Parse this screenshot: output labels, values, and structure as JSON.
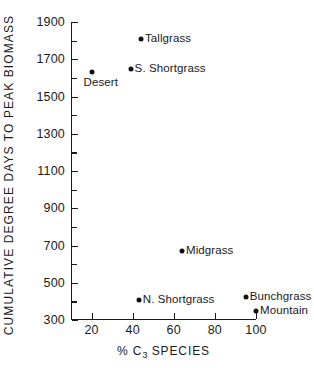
{
  "chart_data": {
    "type": "scatter",
    "title": "",
    "xlabel": "% C3 SPECIES",
    "ylabel": "CUMULATIVE DEGREE DAYS TO PEAK BIOMASS",
    "xlim": [
      10,
      100
    ],
    "ylim": [
      300,
      1900
    ],
    "grid": false,
    "legend": "none",
    "xticks": [
      20,
      40,
      60,
      80,
      100
    ],
    "xtick_labels": [
      "20",
      "40",
      "60",
      "80",
      "100"
    ],
    "yticks": [
      300,
      500,
      700,
      900,
      1100,
      1300,
      1500,
      1700,
      1900
    ],
    "ytick_labels": [
      "300",
      "500",
      "700",
      "900",
      "1100",
      "1300",
      "1500",
      "1700",
      "1900"
    ],
    "y_minor_ticks": [
      400,
      600,
      800,
      1000,
      1200,
      1400,
      1600,
      1800
    ],
    "points": [
      {
        "label": "Tallgrass",
        "x": 44,
        "y": 1810,
        "label_pos": "right"
      },
      {
        "label": "S. Shortgrass",
        "x": 39,
        "y": 1645,
        "label_pos": "right"
      },
      {
        "label": "Desert",
        "x": 20,
        "y": 1630,
        "label_pos": "below"
      },
      {
        "label": "Midgrass",
        "x": 64,
        "y": 670,
        "label_pos": "right"
      },
      {
        "label": "N. Shortgrass",
        "x": 43,
        "y": 410,
        "label_pos": "right"
      },
      {
        "label": "Bunchgrass",
        "x": 95,
        "y": 425,
        "label_pos": "right"
      },
      {
        "label": "Mountain",
        "x": 100,
        "y": 350,
        "label_pos": "right"
      }
    ],
    "marker_color": "#111111",
    "axis_color": "#1a1a1a",
    "background_color": "#ffffff"
  },
  "axis_titles": {
    "x_prefix": "% C",
    "x_subscript": "3",
    "x_suffix": " SPECIES",
    "y": "CUMULATIVE  DEGREE  DAYS  TO  PEAK  BIOMASS"
  }
}
